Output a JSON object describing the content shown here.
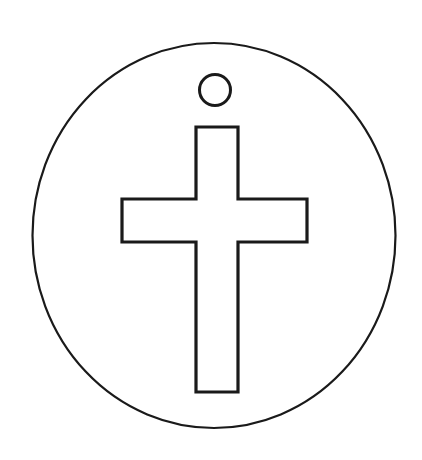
{
  "document": {
    "title": "Cross Medallion Line Drawing",
    "kind": "line-art-illustration",
    "subject": "Christian cross inside a circular pendant/medallion with a hanging hole",
    "canvas": {
      "width": 422,
      "height": 460
    },
    "background_color": "#ffffff",
    "line_color": "#1a1a1a",
    "fill_color": "none"
  },
  "shapes": {
    "medallion": {
      "name": "Outer medallion disc",
      "type": "ellipse",
      "cx": 214,
      "cy": 235.5,
      "rx": 181.5,
      "ry": 192.5,
      "stroke_width": 2.2,
      "stroke_color": "#1a1a1a",
      "fill": "none"
    },
    "hanging_hole": {
      "name": "Hanging hole",
      "type": "circle",
      "cx": 215,
      "cy": 90,
      "r": 15.5,
      "stroke_width": 3.0,
      "stroke_color": "#1a1a1a",
      "fill": "none"
    },
    "cross": {
      "name": "Latin cross outline",
      "type": "polygon",
      "stroke_width": 3.2,
      "stroke_color": "#1a1a1a",
      "fill": "none",
      "bounds": {
        "left": 122,
        "top": 127,
        "right": 307,
        "bottom": 392
      },
      "vertical_bar": {
        "left": 196,
        "right": 238,
        "top": 127,
        "bottom": 392
      },
      "horizontal_bar": {
        "left": 122,
        "right": 307,
        "top": 199,
        "bottom": 242
      },
      "points": "196,127 238,127 238,199 307,199 307,242 238,242 238,392 196,392 196,242 122,242 122,199 196,199"
    }
  }
}
